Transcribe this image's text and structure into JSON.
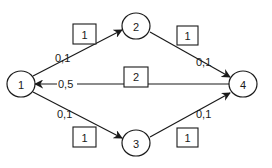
{
  "diagram": {
    "type": "directed-graph",
    "nodes": [
      {
        "id": "1",
        "label": "1"
      },
      {
        "id": "2",
        "label": "2"
      },
      {
        "id": "3",
        "label": "3"
      },
      {
        "id": "4",
        "label": "4"
      }
    ],
    "edges": [
      {
        "from": "1",
        "to": "2",
        "flow_label": "0,1",
        "capacity_label": "1"
      },
      {
        "from": "2",
        "to": "4",
        "flow_label": "0,1",
        "capacity_label": "1"
      },
      {
        "from": "4",
        "to": "1",
        "flow_label": "0,5",
        "capacity_label": "2"
      },
      {
        "from": "1",
        "to": "3",
        "flow_label": "0,1",
        "capacity_label": "1"
      },
      {
        "from": "3",
        "to": "4",
        "flow_label": "0,1",
        "capacity_label": "1"
      }
    ],
    "colors": {
      "stroke": "#1a1a1a",
      "background": "#ffffff"
    }
  }
}
